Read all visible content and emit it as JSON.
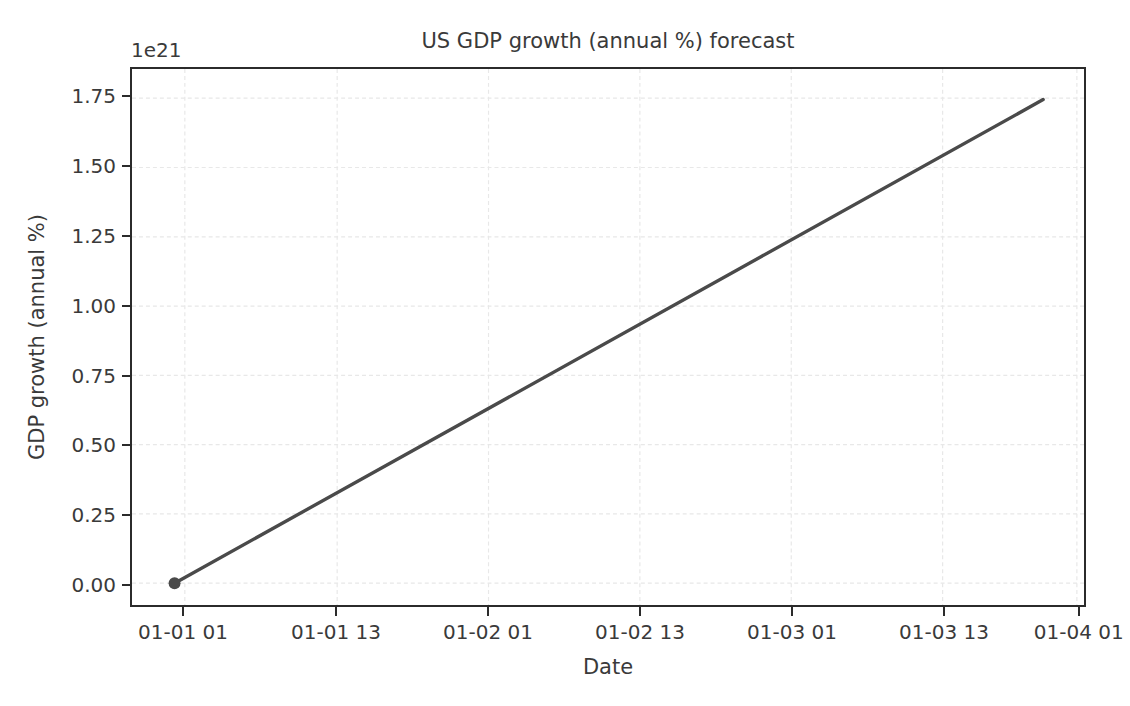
{
  "chart_data": {
    "type": "line",
    "title": "US GDP growth (annual %) forecast",
    "xlabel": "Date",
    "ylabel": "GDP growth (annual %)",
    "y_offset_label": "1e21",
    "y_offset_multiplier": 1e+21,
    "grid": true,
    "legend": "none",
    "line_color": "#4a4a4a",
    "marker_color": "#4a4a4a",
    "axis_color": "#2b2b2b",
    "grid_color": "#e8e8e8",
    "text_color": "#3a3a3a",
    "background_color": "#ffffff",
    "xtick_labels": [
      "01-01 01",
      "01-01 13",
      "01-02 01",
      "01-02 13",
      "01-03 01",
      "01-03 13",
      "01-04 01"
    ],
    "xtick_positions": [
      0.0555,
      0.2155,
      0.3745,
      0.5335,
      0.6925,
      0.8515,
      0.9925
    ],
    "ytick_labels": [
      "0.00",
      "0.25",
      "0.50",
      "0.75",
      "1.00",
      "1.25",
      "1.50",
      "1.75"
    ],
    "ytick_values": [
      0.0,
      0.25,
      0.5,
      0.75,
      1.0,
      1.25,
      1.5,
      1.75
    ],
    "ylim": [
      -0.0786,
      1.8554
    ],
    "xlim_labels": [
      "01-01 00",
      "01-04 02"
    ],
    "series": [
      {
        "name": "GDP growth forecast",
        "marker_at_start": true,
        "x_fraction": [
          0.0447,
          0.9571
        ],
        "values": [
          0.0,
          1.745
        ],
        "points": [
          {
            "x_label": "01-01 01",
            "y": 0.0
          },
          {
            "x_label": "01-01 13",
            "y": 0.2285
          },
          {
            "x_label": "01-02 01",
            "y": 0.4568
          },
          {
            "x_label": "01-02 13",
            "y": 0.6852
          },
          {
            "x_label": "01-03 01",
            "y": 0.9135
          },
          {
            "x_label": "01-03 13",
            "y": 1.1419
          },
          {
            "x_label": "01-04 01",
            "y": 1.3444
          }
        ]
      }
    ]
  }
}
